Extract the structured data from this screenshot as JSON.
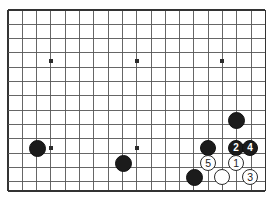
{
  "diagram": {
    "kind": "go-board-diagram",
    "board": {
      "grid_spacing": 14.3,
      "left": 8,
      "top": 10,
      "right": 265,
      "bottom": 191,
      "columns": 19,
      "rows": 14,
      "line_color": "#555555",
      "border_color": "#333333",
      "background_color": "#ffffff"
    },
    "star_points": [
      {
        "name": "star-point-top-left",
        "x": 51,
        "y": 61
      },
      {
        "name": "star-point-top-center",
        "x": 137,
        "y": 61
      },
      {
        "name": "star-point-top-right",
        "x": 222,
        "y": 61
      },
      {
        "name": "star-point-bottom-left",
        "x": 51,
        "y": 148
      },
      {
        "name": "star-point-bottom-center",
        "x": 137,
        "y": 148
      }
    ],
    "stones": [
      {
        "name": "black-stone-left",
        "color": "black",
        "label": "",
        "x": 37,
        "y": 148,
        "r": 8.5
      },
      {
        "name": "black-stone-center",
        "color": "black",
        "label": "",
        "x": 123,
        "y": 163,
        "r": 8.5
      },
      {
        "name": "black-stone-bottom-right",
        "color": "black",
        "label": "",
        "x": 194,
        "y": 177,
        "r": 8.5
      },
      {
        "name": "black-stone-upper-right",
        "color": "black",
        "label": "",
        "x": 236,
        "y": 120,
        "r": 8.5
      },
      {
        "name": "black-stone-right-wall",
        "color": "black",
        "label": "",
        "x": 208,
        "y": 148,
        "r": 8.0
      },
      {
        "name": "black-stone-move-2",
        "color": "black",
        "label": "2",
        "x": 236,
        "y": 148,
        "r": 8.0
      },
      {
        "name": "black-stone-move-4",
        "color": "black",
        "label": "4",
        "x": 250,
        "y": 148,
        "r": 8.0
      },
      {
        "name": "white-stone-move-5",
        "color": "white",
        "label": "5",
        "x": 208,
        "y": 163,
        "r": 8.0
      },
      {
        "name": "white-stone-move-1",
        "color": "white",
        "label": "1",
        "x": 236,
        "y": 163,
        "r": 8.0
      },
      {
        "name": "white-stone-plain",
        "color": "white",
        "label": "",
        "x": 222,
        "y": 177,
        "r": 8.0
      },
      {
        "name": "white-stone-move-3",
        "color": "white",
        "label": "3",
        "x": 250,
        "y": 177,
        "r": 8.0
      }
    ],
    "move_sequence": [
      {
        "number": "1",
        "color": "white"
      },
      {
        "number": "2",
        "color": "black"
      },
      {
        "number": "3",
        "color": "white"
      },
      {
        "number": "4",
        "color": "black"
      },
      {
        "number": "5",
        "color": "white"
      }
    ]
  }
}
